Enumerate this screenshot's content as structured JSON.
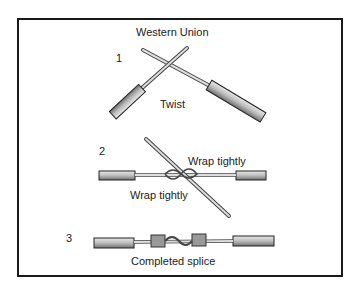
{
  "diagram": {
    "title": "Western Union",
    "steps": [
      {
        "number": "1",
        "caption": "Twist"
      },
      {
        "number": "2",
        "captions": [
          "Wrap tightly",
          "Wrap tightly"
        ]
      },
      {
        "number": "3",
        "caption": "Completed splice"
      }
    ]
  }
}
